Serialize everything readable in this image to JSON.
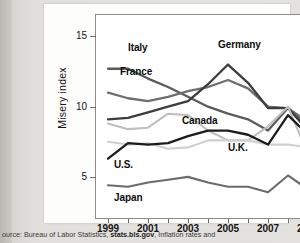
{
  "caption": {
    "prefix": "ource: Bureau of Labor Statistics, ",
    "bold": "stats.bls.gov",
    "suffix": ", Inflation rates and"
  },
  "chart_data": {
    "type": "line",
    "title": "",
    "xlabel": "",
    "ylabel": "Misery index",
    "xlim": [
      1999,
      2009
    ],
    "ylim": [
      2.0,
      16.6
    ],
    "yticks": [
      5,
      10,
      15
    ],
    "ytick_labels": [
      "5",
      "10",
      "15"
    ],
    "xticks": [
      1999,
      2001,
      2003,
      2005,
      2007,
      2009
    ],
    "xtick_labels": [
      "1999",
      "2001",
      "2003",
      "2005",
      "2007",
      "2009"
    ],
    "minor_xticks": [
      2000,
      2002,
      2004,
      2006,
      2008
    ],
    "grid": false,
    "legend": "inline-labels",
    "x": [
      1999,
      2000,
      2001,
      2002,
      2003,
      2004,
      2005,
      2006,
      2007,
      2008,
      2009
    ],
    "series": [
      {
        "name": "Italy",
        "color": "#5b5b5b",
        "width": 2.3,
        "values": [
          12.7,
          12.7,
          12.0,
          11.4,
          10.7,
          10.0,
          9.5,
          9.1,
          8.3,
          9.9,
          8.6
        ],
        "label_x": 2000.0,
        "label_y": 14.1
      },
      {
        "name": "France",
        "color": "#6e6e6e",
        "width": 2.3,
        "values": [
          11.0,
          10.6,
          10.4,
          10.7,
          11.1,
          11.4,
          11.9,
          11.3,
          10.0,
          9.9,
          8.9
        ],
        "label_x": 1999.6,
        "label_y": 12.4
      },
      {
        "name": "Germany",
        "color": "#3d3d3d",
        "width": 2.3,
        "values": [
          9.1,
          9.2,
          9.6,
          10.0,
          10.4,
          11.6,
          13.0,
          11.7,
          9.9,
          9.9,
          8.3
        ],
        "label_x": 2004.5,
        "label_y": 14.3
      },
      {
        "name": "Canada",
        "color": "#bfbfbf",
        "width": 2.1,
        "values": [
          8.8,
          8.4,
          8.5,
          9.5,
          9.4,
          8.3,
          7.6,
          7.6,
          8.6,
          10.0,
          6.6
        ],
        "label_x": 2002.7,
        "label_y": 8.9
      },
      {
        "name": "U.K.",
        "color": "#cfcfcf",
        "width": 2.1,
        "values": [
          7.5,
          7.3,
          7.4,
          7.0,
          7.1,
          7.6,
          7.6,
          7.6,
          7.3,
          7.3,
          7.1
        ],
        "label_x": 2005.0,
        "label_y": 7.0
      },
      {
        "name": "U.S.",
        "color": "#1c1c1c",
        "width": 2.3,
        "values": [
          6.3,
          7.4,
          7.3,
          7.4,
          7.9,
          8.3,
          8.3,
          8.0,
          7.3,
          9.4,
          8.0
        ],
        "label_x": 1999.3,
        "label_y": 5.8
      },
      {
        "name": "Japan",
        "color": "#6b6b6b",
        "width": 2.1,
        "values": [
          4.4,
          4.3,
          4.6,
          4.8,
          5.0,
          4.6,
          4.3,
          4.3,
          3.9,
          5.1,
          4.1
        ],
        "label_x": 1999.3,
        "label_y": 3.4
      }
    ]
  }
}
